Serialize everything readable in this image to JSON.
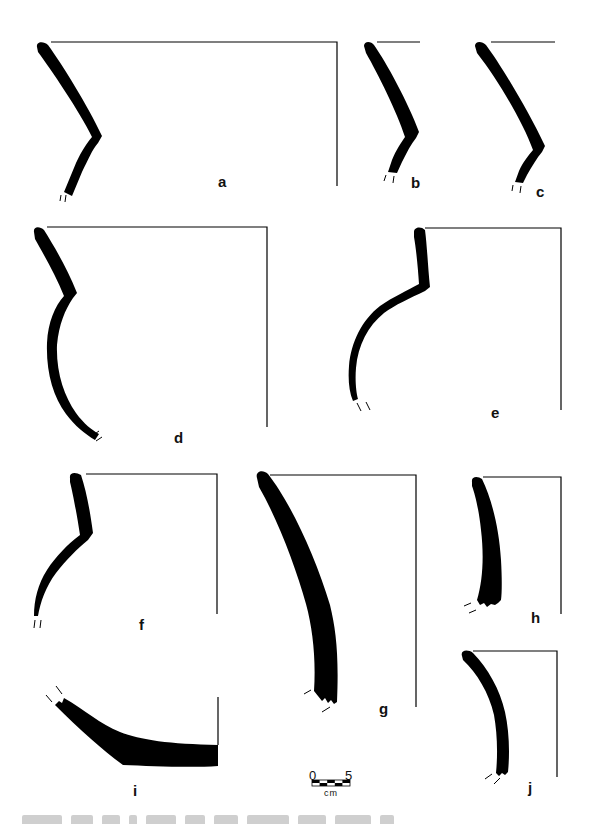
{
  "figure": {
    "type": "ceramic rim sherd profile drawings",
    "profiles": [
      {
        "id": "a",
        "label": "a"
      },
      {
        "id": "b",
        "label": "b"
      },
      {
        "id": "c",
        "label": "c"
      },
      {
        "id": "d",
        "label": "d"
      },
      {
        "id": "e",
        "label": "e"
      },
      {
        "id": "f",
        "label": "f"
      },
      {
        "id": "g",
        "label": "g"
      },
      {
        "id": "h",
        "label": "h"
      },
      {
        "id": "i",
        "label": "i"
      },
      {
        "id": "j",
        "label": "j"
      }
    ],
    "scale_bar": {
      "start_label": "0",
      "end_label": "5",
      "unit": "cm"
    },
    "caption": "",
    "colors": {
      "ink": "#000000",
      "background": "#ffffff"
    }
  }
}
